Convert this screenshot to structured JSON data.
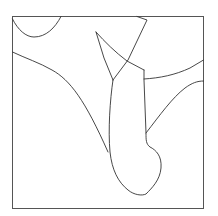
{
  "drawing": {
    "stroke_color": "#333333",
    "frame_color": "#555555",
    "background": "#ffffff",
    "frame": {
      "x": 12,
      "y": 16,
      "width": 192,
      "height": 193
    }
  }
}
